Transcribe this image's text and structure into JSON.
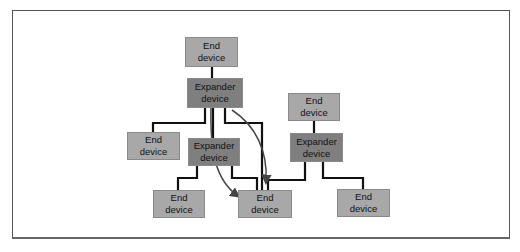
{
  "diagram": {
    "type": "tree topology",
    "nodes": [
      {
        "id": "end-top",
        "label": "End\ndevice",
        "kind": "end",
        "x": 185,
        "y": 37,
        "w": 53,
        "h": 30
      },
      {
        "id": "exp-top",
        "label": "Expander\ndevice",
        "kind": "expander",
        "x": 187,
        "y": 78,
        "w": 56,
        "h": 30
      },
      {
        "id": "end-left",
        "label": "End\ndevice",
        "kind": "end",
        "x": 127,
        "y": 132,
        "w": 53,
        "h": 28
      },
      {
        "id": "exp-mid",
        "label": "Expander\ndevice",
        "kind": "expander",
        "x": 188,
        "y": 138,
        "w": 52,
        "h": 28
      },
      {
        "id": "end-right-top",
        "label": "End\ndevice",
        "kind": "end",
        "x": 288,
        "y": 93,
        "w": 52,
        "h": 28
      },
      {
        "id": "exp-right",
        "label": "Expander\ndevice",
        "kind": "expander",
        "x": 290,
        "y": 133,
        "w": 53,
        "h": 29
      },
      {
        "id": "end-bottom-left",
        "label": "End\ndevice",
        "kind": "end",
        "x": 153,
        "y": 190,
        "w": 52,
        "h": 28
      },
      {
        "id": "end-center",
        "label": "End\ndevice",
        "kind": "end",
        "x": 238,
        "y": 190,
        "w": 54,
        "h": 28
      },
      {
        "id": "end-bottom-right",
        "label": "End\ndevice",
        "kind": "end",
        "x": 337,
        "y": 189,
        "w": 53,
        "h": 28
      }
    ],
    "edges": [
      {
        "from": "end-top",
        "to": "exp-top"
      },
      {
        "from": "exp-top",
        "to": "end-left"
      },
      {
        "from": "exp-top",
        "to": "exp-mid"
      },
      {
        "from": "exp-top",
        "to": "end-center"
      },
      {
        "from": "exp-mid",
        "to": "end-bottom-left"
      },
      {
        "from": "exp-mid",
        "to": "end-center"
      },
      {
        "from": "end-right-top",
        "to": "exp-right"
      },
      {
        "from": "exp-right",
        "to": "end-center"
      },
      {
        "from": "exp-right",
        "to": "end-bottom-right"
      }
    ],
    "arrows": [
      {
        "from": "exp-top",
        "to": "end-center",
        "style": "curved",
        "via": "left"
      },
      {
        "from": "exp-top",
        "to": "end-center",
        "style": "curved",
        "via": "right"
      }
    ],
    "colors": {
      "end_device_fill": "#a8a8a8",
      "expander_fill": "#7f7f7f",
      "wire": "#111111",
      "arrow": "#444444"
    }
  },
  "labels": {
    "end_top": "End device",
    "end_top_l1": "End",
    "end_top_l2": "device",
    "exp_l1": "Expander",
    "exp_l2": "device",
    "end_l1": "End",
    "end_l2": "device"
  }
}
